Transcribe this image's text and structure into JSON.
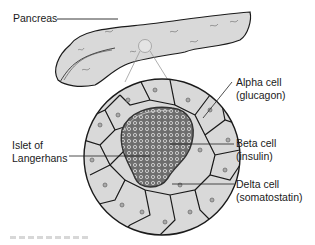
{
  "figure": {
    "type": "anatomical-diagram"
  },
  "labels": {
    "pancreas": "Pancreas",
    "islet": {
      "line1": "Islet of",
      "line2": "Langerhans"
    },
    "alpha": {
      "line1": "Alpha cell",
      "line2": "(glucagon)"
    },
    "beta": {
      "line1": "Beta cell",
      "line2": "(insulin)"
    },
    "delta": {
      "line1": "Delta cell",
      "line2": "(somatostatin)"
    }
  },
  "colors": {
    "tissue_fill": "#d9d9d9",
    "outline": "#1a1a1a",
    "beta_cluster": "#7a7a7a",
    "connector": "#9a9a9a",
    "leader_line": "#222222"
  }
}
